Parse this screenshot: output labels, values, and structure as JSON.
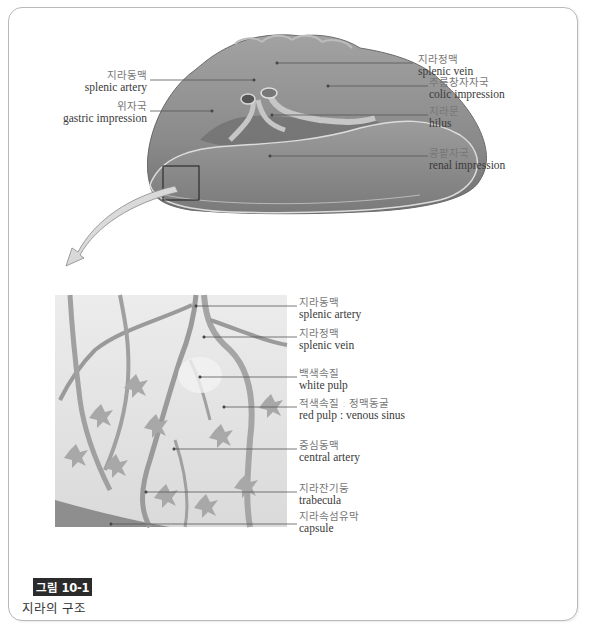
{
  "figure": {
    "number_label": "그림 10-1",
    "title": "지라의 구조"
  },
  "colors": {
    "frame_border": "#b9b9b9",
    "organ_fill": "#8c8c8c",
    "organ_light": "#a9a9a9",
    "leader_line": "#555555",
    "caption_tag_bg": "#2b2b2b"
  },
  "top_diagram": {
    "description": "spleen visceral surface",
    "labels": [
      {
        "ko": "지라동맥",
        "en": "splenic artery"
      },
      {
        "ko": "위자국",
        "en": "gastric impression"
      },
      {
        "ko": "지라정맥",
        "en": "splenic vein"
      },
      {
        "ko": "주름창자자국",
        "en": "colic impression"
      },
      {
        "ko": "지라문",
        "en": "hilus"
      },
      {
        "ko": "콩팥자국",
        "en": "renal impression"
      }
    ]
  },
  "bottom_diagram": {
    "description": "magnified internal structure",
    "labels": [
      {
        "ko": "지라동맥",
        "en": "splenic artery"
      },
      {
        "ko": "지라정맥",
        "en": "splenic vein"
      },
      {
        "ko": "백색속질",
        "en": "white pulp"
      },
      {
        "ko": "적색속질 : 정맥동굴",
        "en": "red pulp : venous sinus"
      },
      {
        "ko": "중심동맥",
        "en": "central artery"
      },
      {
        "ko": "지라잔기둥",
        "en": "trabecula"
      },
      {
        "ko": "지라속섬유막",
        "en": "capsule"
      }
    ]
  }
}
